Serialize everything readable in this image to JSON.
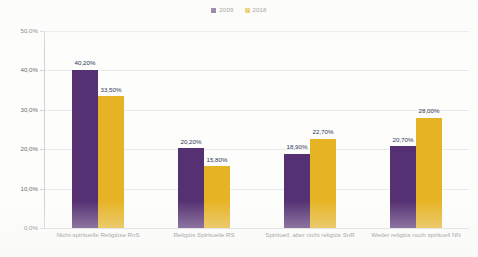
{
  "chart_data": {
    "type": "bar",
    "title": "",
    "subtitle": "",
    "xlabel": "",
    "ylabel": "",
    "ylim": [
      0,
      50
    ],
    "ytick_labels": [
      "50,0%",
      "40,0%",
      "30,0%",
      "20,0%",
      "10,0%",
      "0,0%"
    ],
    "ytick_values": [
      50,
      40,
      30,
      20,
      10,
      0
    ],
    "grid": true,
    "legend_position": "top-center",
    "categories": [
      "Nicht-spirituelle Religiöse RnS",
      "Religiös Spirituelle RS",
      "Spirituell, aber nicht religiös SnR",
      "Weder religiös noch spirituell NN"
    ],
    "series": [
      {
        "name": "2009",
        "color": "#553072",
        "values": [
          40.2,
          20.2,
          18.9,
          20.7
        ],
        "value_labels": [
          "40,20%",
          "20,20%",
          "18,90%",
          "20,70%"
        ]
      },
      {
        "name": "2018",
        "color": "#e5b324",
        "values": [
          33.5,
          15.8,
          22.7,
          28.0
        ],
        "value_labels": [
          "33,50%",
          "15,80%",
          "22,70%",
          "28,00%"
        ]
      }
    ]
  },
  "legend": {
    "items": [
      {
        "label": "2009",
        "color": "#553072"
      },
      {
        "label": "2018",
        "color": "#e5b324"
      }
    ]
  },
  "colors": {
    "series_2009": "#553072",
    "series_2018": "#e5b324",
    "value_label": "#2b3a55",
    "axis_text": "#6d6d6d",
    "gridline": "#e9e9ec",
    "background": "#fdfdfc"
  }
}
